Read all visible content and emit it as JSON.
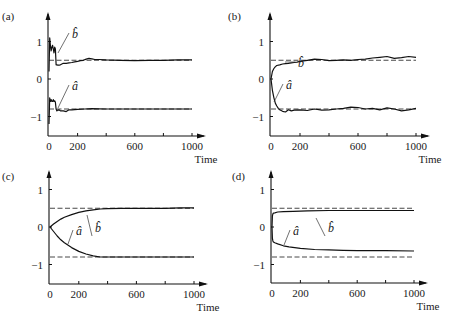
{
  "chart_data": [
    {
      "panel": "(a)",
      "type": "line",
      "xlabel": "Time",
      "ylabel": "",
      "xlim": [
        0,
        1000
      ],
      "ylim": [
        -1.5,
        1.5
      ],
      "xticks": [
        0,
        200,
        400,
        600,
        800,
        1000
      ],
      "xtick_labels": [
        "0",
        "200",
        "",
        "600",
        "",
        "1000"
      ],
      "yticks": [
        1,
        0,
        -1
      ],
      "ytick_labels": [
        "1",
        "0",
        "−1"
      ],
      "reference_lines": [
        0.5,
        -0.8
      ],
      "series": [
        {
          "name": "b̂",
          "x": [
            0,
            5,
            10,
            15,
            20,
            25,
            30,
            35,
            40,
            45,
            50,
            55,
            60,
            70,
            80,
            100,
            120,
            140,
            160,
            180,
            200,
            220,
            240,
            260,
            280,
            300,
            320,
            350,
            400,
            500,
            600,
            700,
            800,
            900,
            1000
          ],
          "values": [
            0.2,
            1.1,
            0.9,
            0.75,
            0.85,
            0.9,
            0.8,
            0.7,
            0.85,
            0.8,
            0.38,
            0.38,
            0.37,
            0.37,
            0.38,
            0.42,
            0.42,
            0.43,
            0.44,
            0.46,
            0.47,
            0.49,
            0.5,
            0.53,
            0.55,
            0.54,
            0.52,
            0.52,
            0.51,
            0.5,
            0.49,
            0.5,
            0.5,
            0.51,
            0.51
          ]
        },
        {
          "name": "â",
          "x": [
            0,
            5,
            10,
            15,
            20,
            25,
            30,
            35,
            40,
            45,
            50,
            55,
            60,
            70,
            80,
            100,
            120,
            140,
            160,
            200,
            250,
            300,
            400,
            500,
            600,
            700,
            800,
            900,
            1000
          ],
          "values": [
            -1.2,
            -0.5,
            -0.6,
            -0.55,
            -0.6,
            -0.6,
            -0.55,
            -0.6,
            -0.58,
            -0.62,
            -0.8,
            -0.85,
            -0.83,
            -0.82,
            -0.85,
            -0.85,
            -0.87,
            -0.82,
            -0.82,
            -0.81,
            -0.8,
            -0.79,
            -0.8,
            -0.8,
            -0.8,
            -0.8,
            -0.8,
            -0.8,
            -0.8
          ]
        }
      ],
      "annotations": [
        "b̂",
        "â"
      ]
    },
    {
      "panel": "(b)",
      "type": "line",
      "xlabel": "Time",
      "xlim": [
        0,
        1000
      ],
      "ylim": [
        -1.5,
        1.5
      ],
      "xticks": [
        0,
        200,
        400,
        600,
        800,
        1000
      ],
      "xtick_labels": [
        "0",
        "200",
        "",
        "600",
        "",
        "1000"
      ],
      "yticks": [
        1,
        0,
        -1
      ],
      "ytick_labels": [
        "1",
        "0",
        "−1"
      ],
      "reference_lines": [
        0.5,
        -0.8
      ],
      "series": [
        {
          "name": "b̂",
          "x": [
            0,
            10,
            20,
            30,
            40,
            60,
            80,
            100,
            120,
            140,
            160,
            180,
            200,
            250,
            300,
            350,
            400,
            450,
            500,
            550,
            600,
            650,
            700,
            750,
            800,
            850,
            900,
            950,
            1000
          ],
          "values": [
            0,
            0.2,
            0.28,
            0.33,
            0.36,
            0.38,
            0.4,
            0.41,
            0.42,
            0.43,
            0.44,
            0.45,
            0.47,
            0.5,
            0.53,
            0.52,
            0.49,
            0.5,
            0.51,
            0.5,
            0.52,
            0.53,
            0.56,
            0.58,
            0.6,
            0.55,
            0.57,
            0.6,
            0.58
          ]
        },
        {
          "name": "â",
          "x": [
            0,
            10,
            20,
            30,
            40,
            50,
            60,
            80,
            100,
            120,
            140,
            160,
            200,
            250,
            300,
            350,
            400,
            450,
            500,
            550,
            600,
            650,
            700,
            750,
            800,
            850,
            900,
            950,
            1000
          ],
          "values": [
            0,
            -0.3,
            -0.5,
            -0.65,
            -0.72,
            -0.78,
            -0.82,
            -0.86,
            -0.88,
            -0.82,
            -0.85,
            -0.83,
            -0.82,
            -0.84,
            -0.8,
            -0.83,
            -0.82,
            -0.8,
            -0.78,
            -0.75,
            -0.76,
            -0.8,
            -0.78,
            -0.82,
            -0.77,
            -0.8,
            -0.85,
            -0.82,
            -0.78
          ]
        }
      ],
      "annotations": [
        "b̂",
        "â"
      ]
    },
    {
      "panel": "(c)",
      "type": "line",
      "xlabel": "Time",
      "xlim": [
        0,
        1000
      ],
      "ylim": [
        -1.5,
        1.5
      ],
      "xticks": [
        0,
        200,
        400,
        600,
        800,
        1000
      ],
      "xtick_labels": [
        "0",
        "200",
        "",
        "600",
        "",
        "1000"
      ],
      "yticks": [
        1,
        0,
        -1
      ],
      "ytick_labels": [
        "1",
        "0",
        "−1"
      ],
      "reference_lines": [
        0.5,
        -0.8
      ],
      "series": [
        {
          "name": "b̂",
          "x": [
            0,
            25,
            50,
            75,
            100,
            150,
            200,
            250,
            300,
            350,
            400,
            500,
            600,
            700,
            800,
            900,
            1000
          ],
          "values": [
            0,
            0.08,
            0.15,
            0.21,
            0.26,
            0.33,
            0.39,
            0.43,
            0.46,
            0.48,
            0.49,
            0.5,
            0.5,
            0.5,
            0.5,
            0.51,
            0.51
          ]
        },
        {
          "name": "â",
          "x": [
            0,
            25,
            50,
            75,
            100,
            150,
            200,
            250,
            300,
            350,
            400,
            500,
            600,
            700,
            800,
            900,
            1000
          ],
          "values": [
            0,
            -0.12,
            -0.24,
            -0.34,
            -0.42,
            -0.55,
            -0.65,
            -0.72,
            -0.77,
            -0.8,
            -0.8,
            -0.8,
            -0.8,
            -0.8,
            -0.8,
            -0.8,
            -0.8
          ]
        }
      ],
      "annotations": [
        "b̂",
        "â"
      ]
    },
    {
      "panel": "(d)",
      "type": "line",
      "xlabel": "Time",
      "xlim": [
        0,
        1000
      ],
      "ylim": [
        -1.5,
        1.5
      ],
      "xticks": [
        0,
        200,
        400,
        600,
        800,
        1000
      ],
      "xtick_labels": [
        "0",
        "200",
        "",
        "600",
        "",
        "1000"
      ],
      "yticks": [
        1,
        0,
        -1
      ],
      "ytick_labels": [
        "1",
        "0",
        "−1"
      ],
      "reference_lines": [
        0.5,
        -0.8
      ],
      "series": [
        {
          "name": "b̂",
          "x": [
            0,
            3,
            6,
            10,
            20,
            40,
            80,
            150,
            250,
            400,
            600,
            800,
            1000
          ],
          "values": [
            0,
            0.3,
            0.35,
            0.37,
            0.38,
            0.4,
            0.41,
            0.42,
            0.43,
            0.44,
            0.44,
            0.44,
            0.44
          ]
        },
        {
          "name": "â",
          "x": [
            0,
            3,
            6,
            10,
            20,
            40,
            80,
            120,
            160,
            200,
            300,
            400,
            500,
            600,
            800,
            1000
          ],
          "values": [
            0,
            -0.3,
            -0.37,
            -0.4,
            -0.42,
            -0.45,
            -0.5,
            -0.53,
            -0.55,
            -0.57,
            -0.6,
            -0.61,
            -0.62,
            -0.63,
            -0.63,
            -0.64
          ]
        }
      ],
      "annotations": [
        "b̂",
        "â"
      ]
    }
  ]
}
